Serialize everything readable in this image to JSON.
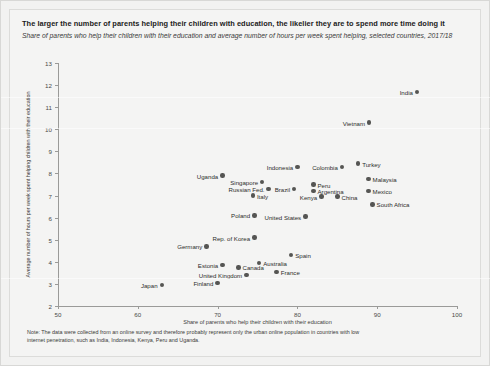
{
  "title": "The larger the number of parents helping their children with education, the likelier they are to spend more time doing it",
  "subtitle": "Share of parents who help their children with their education and average number of hours per week spent helping, selected countries, 2017/18",
  "note": "Note: The data were collected from an online survey and therefore probably represent only the urban online population in countries with low internet penetration, such as India, Indonesia, Kenya, Peru and Uganda.",
  "chart_data": {
    "type": "scatter",
    "title": "The larger the number of parents helping their children with education, the likelier they are to spend more time doing it",
    "subtitle": "Share of parents who help their children with their education and average number of hours per week spent helping, selected countries, 2017/18",
    "xlabel": "Share of parents who help their children with their education",
    "ylabel": "Average number of hours per week spent helping children with their education",
    "xlim": [
      50,
      100
    ],
    "ylim": [
      2,
      13
    ],
    "xticks": [
      50,
      60,
      70,
      80,
      90,
      100
    ],
    "yticks": [
      2,
      3,
      4,
      5,
      6,
      7,
      8,
      9,
      10,
      11,
      12,
      13
    ],
    "grid": false,
    "legend": null,
    "points": [
      {
        "name": "India",
        "x": 95.0,
        "y": 11.7,
        "label_side": "left"
      },
      {
        "name": "Vietnam",
        "x": 89.0,
        "y": 10.3,
        "label_side": "left"
      },
      {
        "name": "Turkey",
        "x": 87.6,
        "y": 8.45,
        "label_side": "right"
      },
      {
        "name": "Indonesia",
        "x": 80.0,
        "y": 8.3,
        "label_side": "left"
      },
      {
        "name": "Colombia",
        "x": 85.6,
        "y": 8.3,
        "label_side": "left"
      },
      {
        "name": "Uganda",
        "x": 70.6,
        "y": 7.9,
        "label_side": "left"
      },
      {
        "name": "Malaysia",
        "x": 88.9,
        "y": 7.75,
        "label_side": "right"
      },
      {
        "name": "Singapore",
        "x": 75.6,
        "y": 7.6,
        "label_side": "left"
      },
      {
        "name": "Peru",
        "x": 82.0,
        "y": 7.5,
        "label_side": "right"
      },
      {
        "name": "Brazil",
        "x": 79.6,
        "y": 7.3,
        "label_side": "left"
      },
      {
        "name": "Russian Fed.",
        "x": 76.4,
        "y": 7.3,
        "label_side": "left"
      },
      {
        "name": "Argentina",
        "x": 82.0,
        "y": 7.2,
        "label_side": "right"
      },
      {
        "name": "Mexico",
        "x": 88.9,
        "y": 7.2,
        "label_side": "right"
      },
      {
        "name": "Italy",
        "x": 74.4,
        "y": 7.0,
        "label_side": "right"
      },
      {
        "name": "Kenya",
        "x": 83.0,
        "y": 6.95,
        "label_side": "left"
      },
      {
        "name": "China",
        "x": 85.0,
        "y": 6.95,
        "label_side": "right"
      },
      {
        "name": "South Africa",
        "x": 89.4,
        "y": 6.6,
        "label_side": "right"
      },
      {
        "name": "Poland",
        "x": 74.6,
        "y": 6.1,
        "label_side": "left"
      },
      {
        "name": "United States",
        "x": 81.0,
        "y": 6.05,
        "label_side": "left"
      },
      {
        "name": "Rep. of Korea",
        "x": 74.6,
        "y": 5.1,
        "label_side": "left"
      },
      {
        "name": "Germany",
        "x": 68.6,
        "y": 4.7,
        "label_side": "left"
      },
      {
        "name": "Spain",
        "x": 79.2,
        "y": 4.3,
        "label_side": "right"
      },
      {
        "name": "Australia",
        "x": 75.2,
        "y": 3.95,
        "label_side": "right"
      },
      {
        "name": "Estonia",
        "x": 70.6,
        "y": 3.85,
        "label_side": "left"
      },
      {
        "name": "Canada",
        "x": 72.6,
        "y": 3.75,
        "label_side": "right"
      },
      {
        "name": "France",
        "x": 77.4,
        "y": 3.55,
        "label_side": "right"
      },
      {
        "name": "United Kingdom",
        "x": 73.6,
        "y": 3.4,
        "label_side": "left"
      },
      {
        "name": "Finland",
        "x": 70.0,
        "y": 3.05,
        "label_side": "left"
      },
      {
        "name": "Japan",
        "x": 63.0,
        "y": 2.95,
        "label_side": "left"
      }
    ]
  }
}
